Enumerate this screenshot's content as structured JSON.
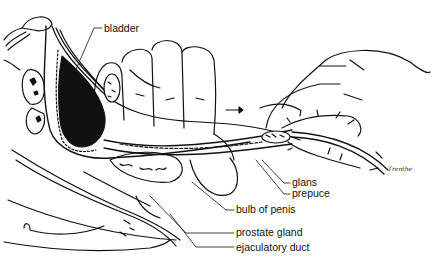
{
  "figure": {
    "type": "anatomical line illustration",
    "labels": [
      {
        "id": "bladder",
        "text": "bladder"
      },
      {
        "id": "glans",
        "text": "glans"
      },
      {
        "id": "prepuce",
        "text": "prepuce"
      },
      {
        "id": "bulb_of_penis",
        "text": "bulb of penis"
      },
      {
        "id": "prostate_gland",
        "text": "prostate gland"
      },
      {
        "id": "ejaculatory_duct",
        "text": "ejaculatory duct"
      }
    ],
    "signature": "Trenthe",
    "annotations": {
      "arrow": "direction-of-catheter-insertion"
    },
    "colors": {
      "ink": "#111111",
      "background": "#ffffff"
    }
  }
}
